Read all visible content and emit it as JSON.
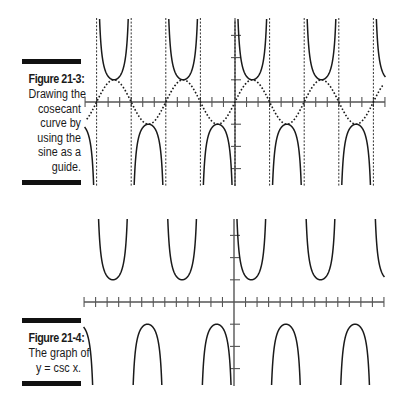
{
  "figures": [
    {
      "label": "Figure 21-3:",
      "caption_lines": [
        "Drawing the",
        "cosecant",
        "curve by",
        "using the",
        "sine as a",
        "guide."
      ]
    },
    {
      "label": "Figure 21-4:",
      "caption_lines": [
        "The graph of",
        "y = csc x."
      ]
    }
  ],
  "chart_data": [
    {
      "type": "line",
      "title": "Figure 21-3: Drawing the cosecant curve by using the sine as a guide.",
      "series": [
        {
          "name": "y = csc x",
          "style": "solid",
          "function": "csc"
        },
        {
          "name": "y = sin x (guide)",
          "style": "dotted",
          "function": "sin"
        },
        {
          "name": "vertical asymptotes x = nπ",
          "style": "dashed",
          "x_values_pi": [
            -4,
            -3,
            -2,
            -1,
            0,
            1,
            2,
            3,
            4
          ]
        }
      ],
      "xlim_pi": [
        -4.2,
        4.2
      ],
      "ylim": [
        -3.8,
        3.8
      ],
      "x_ticks": "every π/3 (13 ticks each side of origin)",
      "y_ticks": [
        -3,
        -2,
        -1,
        1,
        2,
        3
      ],
      "grid": false,
      "xlabel": "",
      "ylabel": ""
    },
    {
      "type": "line",
      "title": "Figure 21-4: The graph of y = csc x.",
      "series": [
        {
          "name": "y = csc x",
          "style": "solid",
          "function": "csc"
        }
      ],
      "xlim_pi": [
        -4.2,
        4.2
      ],
      "ylim": [
        -3.8,
        3.8
      ],
      "x_ticks": "every π/3 (13 ticks each side of origin)",
      "y_ticks": [
        -3,
        -2,
        -1,
        1,
        2,
        3
      ],
      "grid": false,
      "xlabel": "",
      "ylabel": ""
    }
  ],
  "colors": {
    "ink": "#1a1a1a",
    "axis": "#555555"
  }
}
